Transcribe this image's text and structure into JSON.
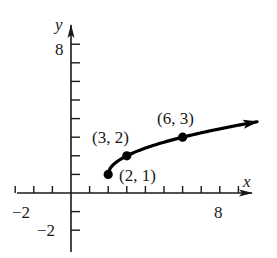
{
  "chart_data": {
    "type": "line",
    "title": "",
    "xlabel": "x",
    "ylabel": "y",
    "xlim": [
      -3,
      10
    ],
    "ylim": [
      -3,
      9
    ],
    "grid": false,
    "x_tick_marks": [
      -3,
      -2,
      -1,
      1,
      2,
      3,
      4,
      5,
      6,
      7,
      8,
      9
    ],
    "y_tick_marks": [
      -2,
      -1,
      1,
      2,
      3,
      4,
      5,
      6,
      7,
      8
    ],
    "x_tick_labels": [
      {
        "value": -2,
        "text": "−2"
      },
      {
        "value": 8,
        "text": "8"
      }
    ],
    "y_tick_labels": [
      {
        "value": 8,
        "text": "8"
      },
      {
        "value": -2,
        "text": "−2"
      }
    ],
    "series": [
      {
        "name": "y = √(x − 2) + 1",
        "x": [
          2,
          2.25,
          2.5,
          3,
          4,
          5,
          6,
          7,
          8,
          9,
          10
        ],
        "y": [
          1,
          1.5,
          1.71,
          2,
          2.41,
          2.73,
          3,
          3.24,
          3.45,
          3.65,
          3.83
        ],
        "end_arrow": true,
        "color": "#000000"
      }
    ],
    "points": [
      {
        "x": 2,
        "y": 1,
        "label": "(2, 1)"
      },
      {
        "x": 3,
        "y": 2,
        "label": "(3, 2)"
      },
      {
        "x": 6,
        "y": 3,
        "label": "(6, 3)"
      }
    ]
  },
  "labels": {
    "x_axis": "x",
    "y_axis": "y",
    "x_neg2": "−2",
    "x_8": "8",
    "y_8": "8",
    "y_neg2": "−2",
    "pt_2_1": "(2, 1)",
    "pt_3_2": "(3, 2)",
    "pt_6_3": "(6, 3)"
  }
}
